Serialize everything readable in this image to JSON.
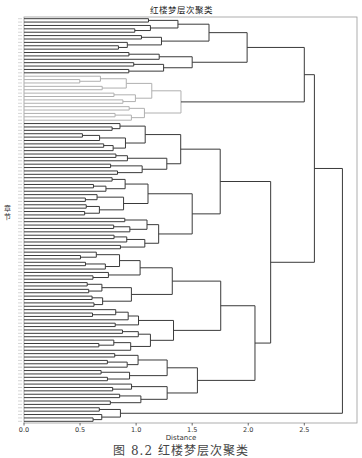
{
  "figure": {
    "title": "红楼梦层次聚类",
    "xlabel": "Distance",
    "ylabel": "章节",
    "caption": "图 8.2  红楼梦层次聚类"
  },
  "colors": {
    "main_line": "#3a3a3a",
    "highlight_cluster": "#b0b0b0",
    "frame": "#9a9a9a"
  },
  "chart_data": {
    "type": "dendrogram",
    "title": "红楼梦层次聚类",
    "xlabel": "Distance",
    "ylabel": "章节",
    "orientation": "left-to-right",
    "leaf_count": 120,
    "xlim": [
      0,
      2.97
    ],
    "xticks": [
      0.0,
      0.5,
      1.0,
      1.5,
      2.0,
      2.5
    ],
    "xtick_labels": [
      "0.0",
      "0.5",
      "1.0",
      "1.5",
      "2.0",
      "2.5"
    ],
    "grid": false,
    "major_merges": [
      {
        "cluster": "top group A",
        "distance": 1.65
      },
      {
        "cluster": "top group B",
        "distance": 1.5
      },
      {
        "cluster": "top group (A+B)",
        "distance": 1.99
      },
      {
        "cluster": "gray highlighted group",
        "distance": 1.4
      },
      {
        "cluster": "top + gray",
        "distance": 2.5
      },
      {
        "cluster": "middle group",
        "distance": 1.75
      },
      {
        "cluster": "lower group",
        "distance": 2.06
      },
      {
        "cluster": "middle + lower",
        "distance": 2.2
      },
      {
        "cluster": "upper half (top+gray) + (middle+lower)",
        "distance": 2.59
      },
      {
        "cluster": "bottom small group",
        "distance": 0.86
      },
      {
        "cluster": "root",
        "distance": 2.84
      }
    ]
  }
}
